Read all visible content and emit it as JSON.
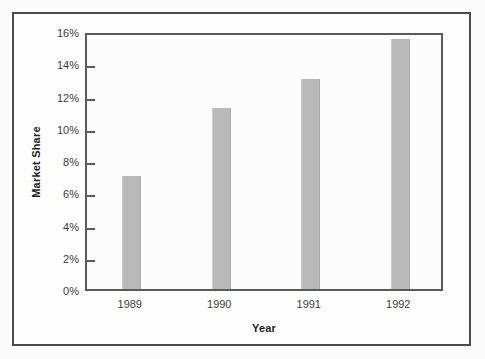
{
  "chart_data": {
    "type": "bar",
    "title": "",
    "subtitle": "",
    "xlabel": "Year",
    "ylabel": "Market Share",
    "categories": [
      "1989",
      "1990",
      "1991",
      "1992"
    ],
    "values": [
      7.0,
      11.2,
      13.0,
      15.5
    ],
    "value_unit": "%",
    "ylim": [
      0,
      16
    ],
    "ytick_values": [
      0,
      2,
      4,
      6,
      8,
      10,
      12,
      14,
      16
    ],
    "ytick_labels": [
      "0%",
      "2%",
      "4%",
      "6%",
      "8%",
      "10%",
      "12%",
      "14%",
      "16%"
    ],
    "grid": false,
    "legend": null,
    "legend_position": "none",
    "series": [
      {
        "name": "Market Share",
        "values": [
          7.0,
          11.2,
          13.0,
          15.5
        ]
      }
    ],
    "colors": {
      "bar_fill": "#b9b9b9",
      "axis_line": "#5a5a5a",
      "frame": "#4a4a4a",
      "text": "#3c3c3c",
      "title_text": "#1d1d1d",
      "plot_background": "#fcfcfc",
      "figure_background": "#fbfbfb"
    }
  }
}
